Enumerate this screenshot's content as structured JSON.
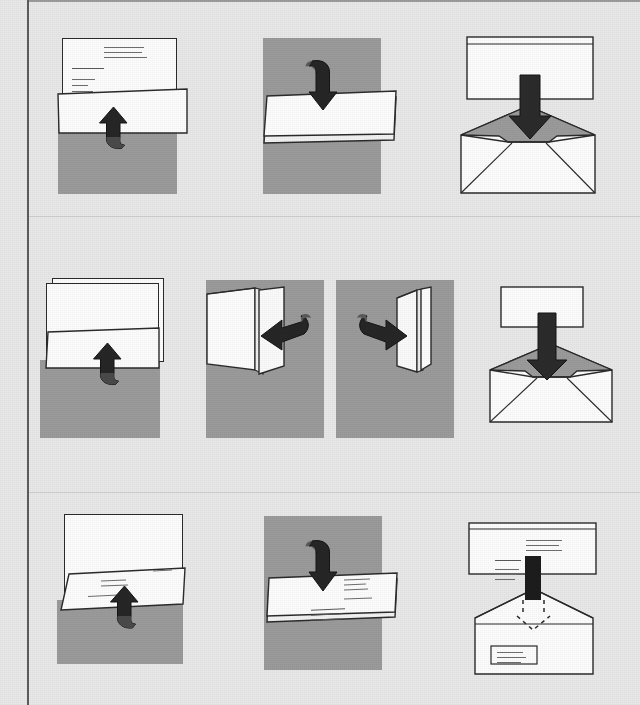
{
  "figure": {
    "background_color": "#e9e9e9",
    "panel_color": "#9b9b9b",
    "paper_color": "#fdfdfd",
    "ink_color": "#2b2b2b",
    "page_border_color": "#5c5c5c",
    "row_count": 3,
    "column_counts": [
      3,
      4,
      3
    ]
  },
  "rows": [
    {
      "name": "row-tri-fold",
      "label": "Tri-fold method",
      "steps": [
        {
          "id": "r1s1",
          "name": "fold-bottom-third-up",
          "caption": "Fold bottom third of the letter upward",
          "arrow": "curved-up-arrow",
          "arrow_direction": "up",
          "has_text_on_sheet": true,
          "sheet_count": 1
        },
        {
          "id": "r1s2",
          "name": "fold-top-third-down",
          "caption": "Fold top third downward over the first fold",
          "arrow": "curved-down-arrow",
          "arrow_direction": "down",
          "has_text_on_sheet": false,
          "sheet_count": 1
        },
        {
          "id": "r1s3",
          "name": "insert-into-envelope",
          "caption": "Insert the folded letter into the envelope",
          "arrow": "straight-down-arrow",
          "arrow_direction": "down",
          "envelope": true,
          "envelope_flap_open": true
        }
      ]
    },
    {
      "name": "row-quarter-fold",
      "label": "Half-and-half (quarter) fold method",
      "steps": [
        {
          "id": "r2s1",
          "name": "fold-sheet-in-half-up",
          "caption": "Fold the stacked sheets in half upward",
          "arrow": "curved-up-arrow",
          "arrow_direction": "up",
          "has_text_on_sheet": false,
          "sheet_count": 2
        },
        {
          "id": "r2s2",
          "name": "fold-left-half-across",
          "caption": "Fold the right half across to the left",
          "arrow": "curved-left-arrow",
          "arrow_direction": "left",
          "orientation": "vertical"
        },
        {
          "id": "r2s3",
          "name": "fold-right-half-across",
          "caption": "Fold remaining half across to the right",
          "arrow": "curved-right-arrow",
          "arrow_direction": "right",
          "orientation": "vertical-narrow"
        },
        {
          "id": "r2s4",
          "name": "insert-into-small-envelope",
          "caption": "Insert the quarter-folded letter into the envelope",
          "arrow": "straight-down-arrow",
          "arrow_direction": "down",
          "envelope": true,
          "envelope_flap_open": true
        }
      ]
    },
    {
      "name": "row-window-envelope-fold",
      "label": "Window-envelope fold method",
      "steps": [
        {
          "id": "r3s1",
          "name": "fold-bottom-up-text-out",
          "caption": "Fold bottom upward keeping the address text facing out",
          "arrow": "curved-up-arrow",
          "arrow_direction": "up",
          "has_text_on_sheet": true,
          "sheet_count": 1
        },
        {
          "id": "r3s2",
          "name": "fold-top-down-text-visible",
          "caption": "Fold the top down so the address stays visible",
          "arrow": "curved-down-arrow",
          "arrow_direction": "down",
          "has_text_on_sheet": true,
          "sheet_count": 1
        },
        {
          "id": "r3s3",
          "name": "insert-into-window-envelope",
          "caption": "Insert so the address shows through the envelope window",
          "arrow": "straight-down-arrow",
          "arrow_direction": "down",
          "ghost_arrow": "dashed-down-arrow",
          "envelope": true,
          "envelope_window": true,
          "has_text_on_sheet": true
        }
      ]
    }
  ]
}
